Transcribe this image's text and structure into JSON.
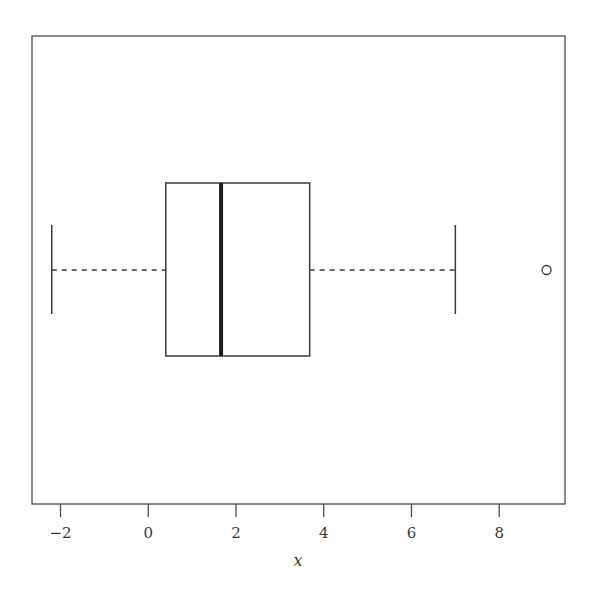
{
  "chart_data": {
    "type": "boxplot",
    "orientation": "horizontal",
    "title": "",
    "xlabel": "x",
    "ylabel": "",
    "xlim": [
      -2.65,
      9.5
    ],
    "x_ticks": [
      -2,
      0,
      2,
      4,
      6,
      8
    ],
    "x_tick_labels": [
      "−2",
      "0",
      "2",
      "4",
      "6",
      "8"
    ],
    "grid": false,
    "legend": "none",
    "box": {
      "whisker_low": -2.2,
      "q1": 0.4,
      "median": 1.66,
      "q3": 3.68,
      "whisker_high": 7.0,
      "outliers": [
        9.08
      ]
    }
  }
}
